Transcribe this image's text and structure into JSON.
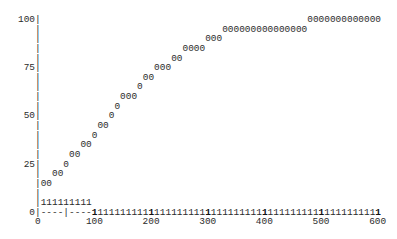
{
  "chart_data": {
    "type": "scatter",
    "style": "ascii-text-plot",
    "title": "",
    "xlabel": "",
    "ylabel": "",
    "xlim": [
      0,
      600
    ],
    "ylim": [
      0,
      100
    ],
    "x_ticks": [
      0,
      100,
      200,
      300,
      400,
      500,
      600
    ],
    "y_ticks": [
      0,
      25,
      50,
      75,
      100
    ],
    "grid": false,
    "legend": null,
    "series": [
      {
        "name": "0",
        "marker": "0",
        "points": [
          {
            "x": 10,
            "y": 15
          },
          {
            "x": 20,
            "y": 15
          },
          {
            "x": 30,
            "y": 20
          },
          {
            "x": 40,
            "y": 20
          },
          {
            "x": 50,
            "y": 25
          },
          {
            "x": 60,
            "y": 30
          },
          {
            "x": 70,
            "y": 30
          },
          {
            "x": 80,
            "y": 35
          },
          {
            "x": 90,
            "y": 35
          },
          {
            "x": 100,
            "y": 40
          },
          {
            "x": 110,
            "y": 45
          },
          {
            "x": 120,
            "y": 45
          },
          {
            "x": 130,
            "y": 50
          },
          {
            "x": 140,
            "y": 55
          },
          {
            "x": 150,
            "y": 60
          },
          {
            "x": 160,
            "y": 60
          },
          {
            "x": 170,
            "y": 60
          },
          {
            "x": 180,
            "y": 65
          },
          {
            "x": 190,
            "y": 70
          },
          {
            "x": 200,
            "y": 70
          },
          {
            "x": 210,
            "y": 75
          },
          {
            "x": 220,
            "y": 75
          },
          {
            "x": 230,
            "y": 75
          },
          {
            "x": 240,
            "y": 80
          },
          {
            "x": 250,
            "y": 80
          },
          {
            "x": 260,
            "y": 85
          },
          {
            "x": 270,
            "y": 85
          },
          {
            "x": 280,
            "y": 85
          },
          {
            "x": 290,
            "y": 85
          },
          {
            "x": 300,
            "y": 90
          },
          {
            "x": 310,
            "y": 90
          },
          {
            "x": 320,
            "y": 90
          },
          {
            "x": 330,
            "y": 95
          },
          {
            "x": 340,
            "y": 95
          },
          {
            "x": 350,
            "y": 95
          },
          {
            "x": 360,
            "y": 95
          },
          {
            "x": 370,
            "y": 95
          },
          {
            "x": 380,
            "y": 95
          },
          {
            "x": 390,
            "y": 95
          },
          {
            "x": 400,
            "y": 95
          },
          {
            "x": 410,
            "y": 95
          },
          {
            "x": 420,
            "y": 95
          },
          {
            "x": 430,
            "y": 95
          },
          {
            "x": 440,
            "y": 95
          },
          {
            "x": 450,
            "y": 95
          },
          {
            "x": 460,
            "y": 95
          },
          {
            "x": 470,
            "y": 95
          },
          {
            "x": 480,
            "y": 100
          },
          {
            "x": 490,
            "y": 100
          },
          {
            "x": 500,
            "y": 100
          },
          {
            "x": 510,
            "y": 100
          },
          {
            "x": 520,
            "y": 100
          },
          {
            "x": 530,
            "y": 100
          },
          {
            "x": 540,
            "y": 100
          },
          {
            "x": 550,
            "y": 100
          },
          {
            "x": 560,
            "y": 100
          },
          {
            "x": 570,
            "y": 100
          },
          {
            "x": 580,
            "y": 100
          },
          {
            "x": 590,
            "y": 100
          },
          {
            "x": 600,
            "y": 100
          }
        ]
      },
      {
        "name": "1",
        "marker": "1",
        "points": [
          {
            "x": 10,
            "y": 5
          },
          {
            "x": 20,
            "y": 5
          },
          {
            "x": 30,
            "y": 5
          },
          {
            "x": 40,
            "y": 5
          },
          {
            "x": 50,
            "y": 5
          },
          {
            "x": 60,
            "y": 5
          },
          {
            "x": 70,
            "y": 5
          },
          {
            "x": 80,
            "y": 5
          },
          {
            "x": 90,
            "y": 5
          },
          {
            "x": 100,
            "y": 0
          },
          {
            "x": 110,
            "y": 0
          },
          {
            "x": 120,
            "y": 0
          },
          {
            "x": 130,
            "y": 0
          },
          {
            "x": 140,
            "y": 0
          },
          {
            "x": 150,
            "y": 0
          },
          {
            "x": 160,
            "y": 0
          },
          {
            "x": 170,
            "y": 0
          },
          {
            "x": 180,
            "y": 0
          },
          {
            "x": 190,
            "y": 0
          },
          {
            "x": 200,
            "y": 0
          },
          {
            "x": 210,
            "y": 0
          },
          {
            "x": 220,
            "y": 0
          },
          {
            "x": 230,
            "y": 0
          },
          {
            "x": 240,
            "y": 0
          },
          {
            "x": 250,
            "y": 0
          },
          {
            "x": 260,
            "y": 0
          },
          {
            "x": 270,
            "y": 0
          },
          {
            "x": 280,
            "y": 0
          },
          {
            "x": 290,
            "y": 0
          },
          {
            "x": 300,
            "y": 0
          },
          {
            "x": 310,
            "y": 0
          },
          {
            "x": 320,
            "y": 0
          },
          {
            "x": 330,
            "y": 0
          },
          {
            "x": 340,
            "y": 0
          },
          {
            "x": 350,
            "y": 0
          },
          {
            "x": 360,
            "y": 0
          },
          {
            "x": 370,
            "y": 0
          },
          {
            "x": 380,
            "y": 0
          },
          {
            "x": 390,
            "y": 0
          },
          {
            "x": 400,
            "y": 0
          },
          {
            "x": 410,
            "y": 0
          },
          {
            "x": 420,
            "y": 0
          },
          {
            "x": 430,
            "y": 0
          },
          {
            "x": 440,
            "y": 0
          },
          {
            "x": 450,
            "y": 0
          },
          {
            "x": 460,
            "y": 0
          },
          {
            "x": 470,
            "y": 0
          },
          {
            "x": 480,
            "y": 0
          },
          {
            "x": 490,
            "y": 0
          },
          {
            "x": 500,
            "y": 0
          },
          {
            "x": 510,
            "y": 0
          },
          {
            "x": 520,
            "y": 0
          },
          {
            "x": 530,
            "y": 0
          },
          {
            "x": 540,
            "y": 0
          },
          {
            "x": 550,
            "y": 0
          },
          {
            "x": 560,
            "y": 0
          },
          {
            "x": 570,
            "y": 0
          },
          {
            "x": 580,
            "y": 0
          },
          {
            "x": 590,
            "y": 0
          },
          {
            "x": 600,
            "y": 0
          }
        ]
      }
    ]
  },
  "grid": {
    "cols": 60,
    "rows": 20,
    "x_per_col": 10,
    "y_per_row": 5,
    "label_width": 3,
    "axis_char": "|",
    "dash_char": "-",
    "minor_tick_col": 5,
    "major_tick_every": 10
  },
  "axes": {
    "y_labels": {
      "0": "100",
      "5": "75",
      "10": "50",
      "15": "25",
      "20": "0"
    },
    "x_labels": [
      "0",
      "100",
      "200",
      "300",
      "400",
      "500",
      "600"
    ]
  },
  "colors": {
    "text": "#2b2b2b",
    "background": "#ffffff"
  }
}
